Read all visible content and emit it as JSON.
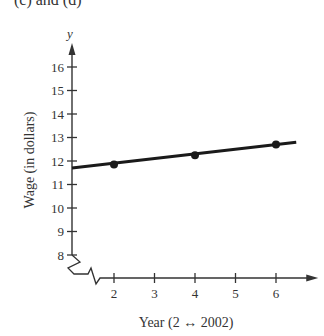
{
  "header_fragment": "(c) and (d)",
  "chart_data": {
    "type": "line",
    "title": "",
    "xlabel": "Year (2 ↔ 2002)",
    "ylabel": "Wage (in dollars)",
    "x_var": "t",
    "y_var": "y",
    "x_ticks": [
      2,
      3,
      4,
      5,
      6
    ],
    "y_ticks": [
      8,
      9,
      10,
      11,
      12,
      13,
      14,
      15,
      16
    ],
    "xlim": [
      1,
      6.5
    ],
    "ylim": [
      8,
      16.5
    ],
    "axis_breaks": [
      "x",
      "y"
    ],
    "grid": false,
    "series": [
      {
        "name": "Wage trend line",
        "kind": "line",
        "x": [
          1,
          6.5
        ],
        "y": [
          11.7,
          12.8
        ]
      },
      {
        "name": "Data points",
        "kind": "scatter",
        "x": [
          2,
          4,
          6
        ],
        "y": [
          11.85,
          12.25,
          12.7
        ]
      }
    ],
    "colors": {
      "line": "#1a1a1a",
      "axis": "#333333"
    }
  }
}
